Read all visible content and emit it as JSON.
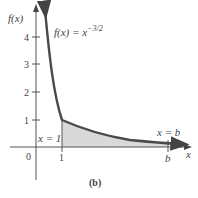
{
  "figure": {
    "label": "(b)",
    "function_label": "f(x) = x",
    "exponent": "−3/2",
    "y_axis_label": "f(x)",
    "x_axis_label": "x",
    "origin_label": "0",
    "y_ticks": [
      "1",
      "2",
      "3",
      "4"
    ],
    "x_ticks": [
      "1",
      "b"
    ],
    "boundary_left": "x = 1",
    "boundary_right": "x = b"
  },
  "colors": {
    "curve": "#4a4a4a",
    "shade": "#d9d9d9",
    "axis": "#555555"
  }
}
